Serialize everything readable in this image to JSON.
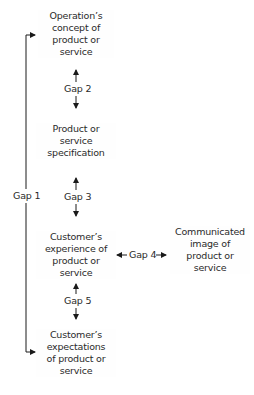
{
  "diagram": {
    "nodes": {
      "operation_concept": {
        "lines": [
          "Operation’s",
          "concept of",
          "product or",
          "service"
        ]
      },
      "specification": {
        "lines": [
          "Product or",
          "service",
          "specification"
        ]
      },
      "customer_experience": {
        "lines": [
          "Customer’s",
          "experience of",
          "product or",
          "service"
        ]
      },
      "communicated_image": {
        "lines": [
          "Communicated",
          "image of",
          "product or",
          "service"
        ]
      },
      "customer_expectations": {
        "lines": [
          "Customer’s",
          "expectations",
          "of product or",
          "service"
        ]
      }
    },
    "gaps": {
      "gap1": "Gap 1",
      "gap2": "Gap 2",
      "gap3": "Gap 3",
      "gap4": "Gap 4",
      "gap5": "Gap 5"
    },
    "colors": {
      "text": "#2a2a2a",
      "line": "#1a1a1a",
      "background": "#ffffff"
    }
  }
}
